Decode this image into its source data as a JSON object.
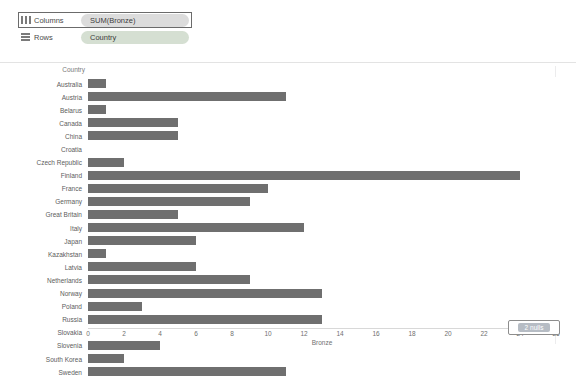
{
  "shelves": {
    "columns": {
      "label": "Columns",
      "pill": "SUM(Bronze)",
      "icon": "columns-grid-icon",
      "selected": true
    },
    "rows": {
      "label": "Rows",
      "pill": "Country",
      "icon": "rows-grid-icon",
      "selected": false
    }
  },
  "row_header_title": "Country",
  "null_indicator": {
    "text": "2 nulls"
  },
  "colors": {
    "bar": "#6f6f6f",
    "pill_bg": "#dcdcdc",
    "pill_green_bg": "#d5dfd2",
    "axis_text": "#6f6f6f",
    "label_text": "#5c5c5c",
    "selected_border": "#6b6b6b",
    "null_chip_bg": "#b6bcc4"
  },
  "chart_data": {
    "type": "bar",
    "title": "",
    "xlabel": "Bronze",
    "ylabel": "Country",
    "orientation": "horizontal",
    "xlim": [
      0,
      26
    ],
    "xticks": [
      0,
      2,
      4,
      6,
      8,
      10,
      12,
      14,
      16,
      18,
      20,
      22,
      24,
      26
    ],
    "grid": false,
    "legend": "none",
    "categories": [
      "Australia",
      "Austria",
      "Belarus",
      "Canada",
      "China",
      "Croatia",
      "Czech Republic",
      "Finland",
      "France",
      "Germany",
      "Great Britain",
      "Italy",
      "Japan",
      "Kazakhstan",
      "Latvia",
      "Netherlands",
      "Norway",
      "Poland",
      "Russia",
      "Slovakia",
      "Slovenia",
      "South Korea",
      "Sweden"
    ],
    "values": [
      1,
      11,
      1,
      5,
      5,
      0,
      2,
      24,
      10,
      9,
      5,
      12,
      6,
      1,
      6,
      9,
      13,
      3,
      13,
      0,
      4,
      2,
      11
    ],
    "nulls": 2,
    "annotations": [
      "2 nulls"
    ]
  }
}
